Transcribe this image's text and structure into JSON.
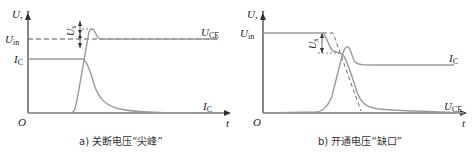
{
  "panels": [
    {
      "id": "a",
      "caption": "a) 关断电压“尖峰”",
      "axis_label": "U, I",
      "origin_label": "O",
      "t_label": "t",
      "labels": {
        "Uin": {
          "main": "U",
          "sub": "in"
        },
        "IC_left": {
          "main": "I",
          "sub": "C"
        },
        "UCE": {
          "main": "U",
          "sub": "CE"
        },
        "IC_right": {
          "main": "I",
          "sub": "C"
        },
        "Us": {
          "main": "U",
          "sub": "s"
        }
      }
    },
    {
      "id": "b",
      "caption": "b) 开通电压“缺口”",
      "axis_label": "U, I",
      "origin_label": "O",
      "t_label": "t",
      "labels": {
        "Uin": {
          "main": "U",
          "sub": "in"
        },
        "IC": {
          "main": "I",
          "sub": "C"
        },
        "UCE": {
          "main": "U",
          "sub": "CE"
        },
        "Us": {
          "main": "U",
          "sub": "s"
        }
      }
    }
  ],
  "colors": {
    "axis": "#333333",
    "curve": "#9a9a9a",
    "dashed": "#555555",
    "text": "#222222"
  }
}
